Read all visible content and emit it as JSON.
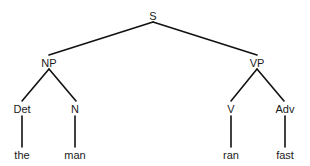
{
  "diagram": {
    "type": "syntax-tree",
    "nodes": {
      "s": {
        "label": "S",
        "x": 153,
        "y": 16
      },
      "np": {
        "label": "NP",
        "x": 49,
        "y": 63
      },
      "vp": {
        "label": "VP",
        "x": 257,
        "y": 63
      },
      "det": {
        "label": "Det",
        "x": 22,
        "y": 109
      },
      "n": {
        "label": "N",
        "x": 75,
        "y": 109
      },
      "v": {
        "label": "V",
        "x": 231,
        "y": 109
      },
      "adv": {
        "label": "Adv",
        "x": 285,
        "y": 109
      },
      "the": {
        "label": "the",
        "x": 22,
        "y": 155
      },
      "man": {
        "label": "man",
        "x": 75,
        "y": 155
      },
      "ran": {
        "label": "ran",
        "x": 231,
        "y": 155
      },
      "fast": {
        "label": "fast",
        "x": 285,
        "y": 155
      }
    },
    "edges": [
      {
        "from": "S",
        "to": "NP"
      },
      {
        "from": "S",
        "to": "VP"
      },
      {
        "from": "NP",
        "to": "Det"
      },
      {
        "from": "NP",
        "to": "N"
      },
      {
        "from": "VP",
        "to": "V"
      },
      {
        "from": "VP",
        "to": "Adv"
      },
      {
        "from": "Det",
        "to": "the"
      },
      {
        "from": "N",
        "to": "man"
      },
      {
        "from": "V",
        "to": "ran"
      },
      {
        "from": "Adv",
        "to": "fast"
      }
    ],
    "line_color": "#111111"
  }
}
